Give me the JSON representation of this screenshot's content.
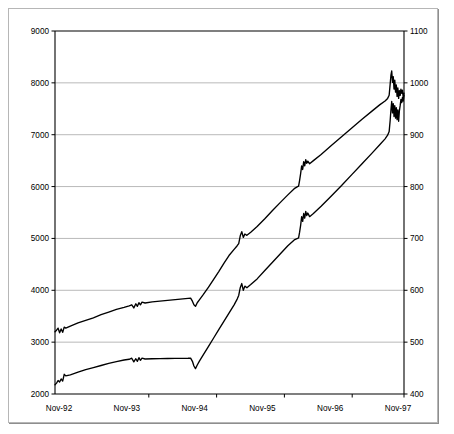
{
  "chart_data": {
    "type": "line",
    "title": "",
    "subtitle": "",
    "xlabel": "",
    "ylabel": "",
    "grid": true,
    "legend": "none",
    "background": "#ffffff",
    "line_color": "#000000",
    "grid_color": "#9a9a9a",
    "frame_color": "#b6b6b6",
    "axes": {
      "left": {
        "label": "",
        "min": 2000,
        "max": 9000,
        "step": 1000,
        "ticks": [
          "2000",
          "3000",
          "4000",
          "5000",
          "6000",
          "7000",
          "8000",
          "9000"
        ]
      },
      "right": {
        "label": "",
        "min": 400,
        "max": 1100,
        "step": 100,
        "ticks": [
          "400",
          "500",
          "600",
          "700",
          "800",
          "900",
          "1000",
          "1100"
        ]
      },
      "x": {
        "label": "",
        "ticks": [
          "Nov-92",
          "Nov-93",
          "Nov-94",
          "Nov-95",
          "Nov-96",
          "Nov-97"
        ]
      }
    },
    "series": [
      {
        "name": "upper-series",
        "axis": "left",
        "color": "#000000",
        "points": [
          [
            0.0,
            3200
          ],
          [
            0.006,
            3230
          ],
          [
            0.012,
            3270
          ],
          [
            0.018,
            3180
          ],
          [
            0.024,
            3255
          ],
          [
            0.03,
            3190
          ],
          [
            0.036,
            3290
          ],
          [
            0.042,
            3270
          ],
          [
            0.06,
            3310
          ],
          [
            0.09,
            3370
          ],
          [
            0.12,
            3420
          ],
          [
            0.15,
            3470
          ],
          [
            0.18,
            3530
          ],
          [
            0.21,
            3580
          ],
          [
            0.24,
            3630
          ],
          [
            0.27,
            3670
          ],
          [
            0.29,
            3700
          ],
          [
            0.3,
            3720
          ],
          [
            0.308,
            3660
          ],
          [
            0.316,
            3740
          ],
          [
            0.322,
            3690
          ],
          [
            0.328,
            3760
          ],
          [
            0.334,
            3720
          ],
          [
            0.34,
            3770
          ],
          [
            0.352,
            3755
          ],
          [
            0.38,
            3775
          ],
          [
            0.41,
            3790
          ],
          [
            0.44,
            3805
          ],
          [
            0.47,
            3820
          ],
          [
            0.5,
            3835
          ],
          [
            0.52,
            3845
          ],
          [
            0.53,
            3850
          ],
          [
            0.537,
            3790
          ],
          [
            0.543,
            3720
          ],
          [
            0.549,
            3690
          ],
          [
            0.556,
            3760
          ],
          [
            0.565,
            3820
          ],
          [
            0.58,
            3920
          ],
          [
            0.6,
            4060
          ],
          [
            0.62,
            4210
          ],
          [
            0.64,
            4360
          ],
          [
            0.66,
            4520
          ],
          [
            0.68,
            4670
          ],
          [
            0.7,
            4790
          ],
          [
            0.712,
            4860
          ],
          [
            0.718,
            4900
          ],
          [
            0.724,
            5050
          ],
          [
            0.73,
            5130
          ],
          [
            0.736,
            5020
          ],
          [
            0.742,
            5085
          ],
          [
            0.75,
            5060
          ],
          [
            0.765,
            5120
          ],
          [
            0.79,
            5230
          ],
          [
            0.82,
            5380
          ],
          [
            0.85,
            5540
          ],
          [
            0.88,
            5690
          ],
          [
            0.91,
            5840
          ],
          [
            0.935,
            5960
          ],
          [
            0.948,
            6000
          ],
          [
            0.952,
            6010
          ],
          [
            0.956,
            6120
          ],
          [
            0.96,
            6250
          ],
          [
            0.964,
            6400
          ],
          [
            0.968,
            6330
          ],
          [
            0.972,
            6480
          ],
          [
            0.976,
            6400
          ],
          [
            0.98,
            6520
          ],
          [
            0.984,
            6450
          ],
          [
            0.988,
            6490
          ],
          [
            0.995,
            6440
          ],
          [
            1.01,
            6500
          ],
          [
            1.04,
            6620
          ],
          [
            1.08,
            6790
          ],
          [
            1.12,
            6960
          ],
          [
            1.16,
            7130
          ],
          [
            1.2,
            7300
          ],
          [
            1.24,
            7460
          ],
          [
            1.27,
            7580
          ],
          [
            1.29,
            7650
          ],
          [
            1.3,
            7700
          ],
          [
            1.306,
            7760
          ],
          [
            1.31,
            7980
          ],
          [
            1.313,
            8150
          ],
          [
            1.316,
            8230
          ],
          [
            1.319,
            8010
          ],
          [
            1.322,
            8120
          ],
          [
            1.325,
            7880
          ],
          [
            1.328,
            8050
          ],
          [
            1.331,
            7820
          ],
          [
            1.334,
            7960
          ],
          [
            1.337,
            7740
          ],
          [
            1.34,
            7900
          ],
          [
            1.343,
            7700
          ],
          [
            1.346,
            7850
          ],
          [
            1.349,
            7760
          ],
          [
            1.352,
            7880
          ],
          [
            1.355,
            7800
          ],
          [
            1.358,
            7860
          ],
          [
            1.361,
            7720
          ],
          [
            1.364,
            7800
          ]
        ]
      },
      {
        "name": "lower-series",
        "axis": "left",
        "color": "#000000",
        "points": [
          [
            0.0,
            2180
          ],
          [
            0.006,
            2210
          ],
          [
            0.012,
            2260
          ],
          [
            0.018,
            2230
          ],
          [
            0.024,
            2290
          ],
          [
            0.03,
            2250
          ],
          [
            0.036,
            2380
          ],
          [
            0.042,
            2350
          ],
          [
            0.06,
            2370
          ],
          [
            0.09,
            2420
          ],
          [
            0.12,
            2470
          ],
          [
            0.15,
            2510
          ],
          [
            0.18,
            2550
          ],
          [
            0.21,
            2590
          ],
          [
            0.24,
            2625
          ],
          [
            0.27,
            2655
          ],
          [
            0.29,
            2670
          ],
          [
            0.3,
            2690
          ],
          [
            0.308,
            2620
          ],
          [
            0.316,
            2680
          ],
          [
            0.322,
            2630
          ],
          [
            0.328,
            2700
          ],
          [
            0.334,
            2650
          ],
          [
            0.34,
            2690
          ],
          [
            0.352,
            2675
          ],
          [
            0.38,
            2680
          ],
          [
            0.41,
            2682
          ],
          [
            0.44,
            2685
          ],
          [
            0.47,
            2686
          ],
          [
            0.5,
            2688
          ],
          [
            0.52,
            2690
          ],
          [
            0.53,
            2692
          ],
          [
            0.537,
            2630
          ],
          [
            0.543,
            2540
          ],
          [
            0.549,
            2490
          ],
          [
            0.556,
            2560
          ],
          [
            0.565,
            2640
          ],
          [
            0.58,
            2760
          ],
          [
            0.6,
            2920
          ],
          [
            0.62,
            3080
          ],
          [
            0.64,
            3240
          ],
          [
            0.66,
            3400
          ],
          [
            0.68,
            3560
          ],
          [
            0.7,
            3720
          ],
          [
            0.712,
            3830
          ],
          [
            0.718,
            3900
          ],
          [
            0.724,
            4050
          ],
          [
            0.73,
            4130
          ],
          [
            0.736,
            4000
          ],
          [
            0.742,
            4080
          ],
          [
            0.75,
            4050
          ],
          [
            0.765,
            4110
          ],
          [
            0.79,
            4220
          ],
          [
            0.82,
            4380
          ],
          [
            0.85,
            4540
          ],
          [
            0.88,
            4700
          ],
          [
            0.91,
            4860
          ],
          [
            0.935,
            4970
          ],
          [
            0.948,
            5000
          ],
          [
            0.952,
            5010
          ],
          [
            0.956,
            5120
          ],
          [
            0.96,
            5250
          ],
          [
            0.964,
            5420
          ],
          [
            0.968,
            5330
          ],
          [
            0.972,
            5480
          ],
          [
            0.976,
            5390
          ],
          [
            0.98,
            5520
          ],
          [
            0.984,
            5440
          ],
          [
            0.988,
            5490
          ],
          [
            0.995,
            5420
          ],
          [
            1.01,
            5480
          ],
          [
            1.04,
            5620
          ],
          [
            1.08,
            5820
          ],
          [
            1.12,
            6020
          ],
          [
            1.16,
            6230
          ],
          [
            1.2,
            6440
          ],
          [
            1.24,
            6650
          ],
          [
            1.27,
            6810
          ],
          [
            1.29,
            6920
          ],
          [
            1.3,
            6990
          ],
          [
            1.306,
            7060
          ],
          [
            1.31,
            7280
          ],
          [
            1.313,
            7480
          ],
          [
            1.316,
            7640
          ],
          [
            1.319,
            7420
          ],
          [
            1.322,
            7600
          ],
          [
            1.325,
            7350
          ],
          [
            1.328,
            7560
          ],
          [
            1.331,
            7320
          ],
          [
            1.334,
            7520
          ],
          [
            1.337,
            7290
          ],
          [
            1.34,
            7480
          ],
          [
            1.343,
            7260
          ],
          [
            1.346,
            7460
          ],
          [
            1.349,
            7560
          ],
          [
            1.352,
            7680
          ],
          [
            1.355,
            7620
          ],
          [
            1.358,
            7720
          ],
          [
            1.361,
            7650
          ],
          [
            1.364,
            7760
          ]
        ]
      }
    ]
  }
}
